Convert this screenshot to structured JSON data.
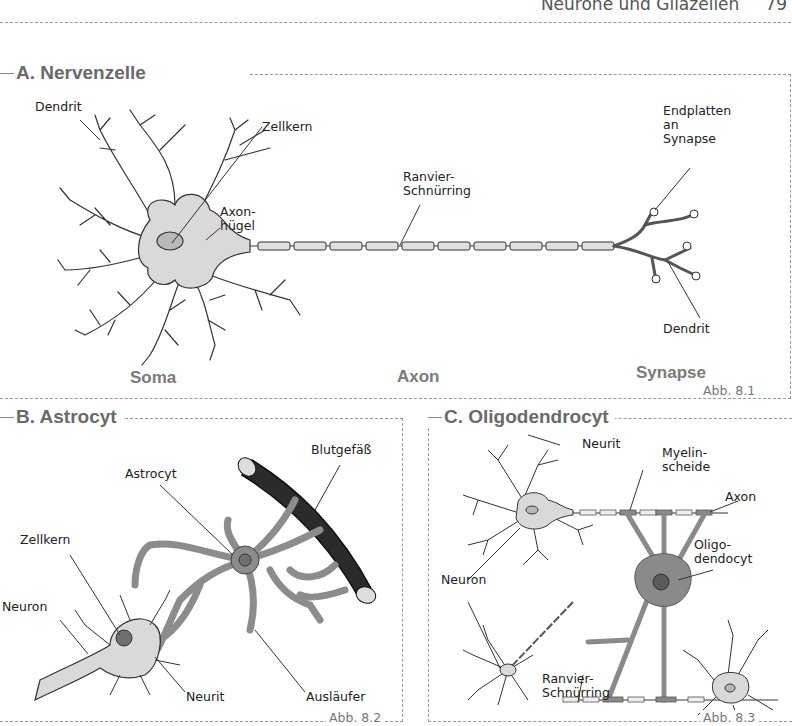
{
  "page": {
    "running_head": "Neurone und Gliazellen",
    "page_number": "79"
  },
  "panels": {
    "a": {
      "title": "A. Nervenzelle",
      "figure": "Abb. 8.1",
      "labels": {
        "dendrit_top": "Dendrit",
        "zellkern": "Zellkern",
        "axonhuegel": "Axon-\nhügel",
        "ranvier": "Ranvier-\nSchnürring",
        "endplatten": "Endplatten\nan\nSynapse",
        "dendrit_right": "Dendrit"
      },
      "sections": [
        "Soma",
        "Axon",
        "Synapse"
      ]
    },
    "b": {
      "title": "B. Astrocyt",
      "figure": "Abb. 8.2",
      "labels": {
        "blutgefaess": "Blutgefäß",
        "astrocyt": "Astrocyt",
        "zellkern": "Zellkern",
        "neuron": "Neuron",
        "neurit": "Neurit",
        "auslaeufer": "Ausläufer"
      }
    },
    "c": {
      "title": "C. Oligodendrocyt",
      "figure": "Abb. 8.3",
      "labels": {
        "neurit": "Neurit",
        "myelinscheide": "Myelin-\nscheide",
        "axon": "Axon",
        "oligodendocyt": "Oligo-\ndendocyt",
        "neuron": "Neuron",
        "ranvier": "Ranvier-\nSchnürring"
      }
    }
  },
  "colors": {
    "soma_fill": "#d9d9d9",
    "astro_fill": "#8c8c8c",
    "vessel_fill": "#2b2b2b",
    "oligo_fill": "#8a8a8a",
    "title_gray": "#6a6a6a"
  }
}
